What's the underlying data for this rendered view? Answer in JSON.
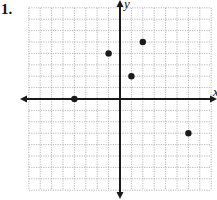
{
  "problem": {
    "number_label": "1."
  },
  "chart_data": {
    "type": "scatter",
    "title": "",
    "xlabel": "x",
    "ylabel": "y",
    "xlim": [
      -8,
      8
    ],
    "ylim": [
      -8,
      8
    ],
    "grid": true,
    "grid_step": 1,
    "tick_labels_shown": false,
    "points": [
      {
        "x": -4,
        "y": 0
      },
      {
        "x": -1,
        "y": 4
      },
      {
        "x": 2,
        "y": 5
      },
      {
        "x": 1,
        "y": 2
      },
      {
        "x": 6,
        "y": -3
      }
    ],
    "marker_color": "#1a1a1a",
    "axis_color": "#1a1a1a",
    "grid_color": "#9a9a9a"
  }
}
